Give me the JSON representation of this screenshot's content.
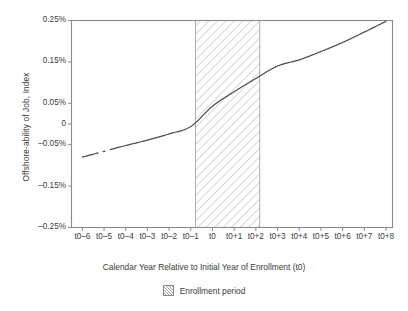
{
  "chart_data": {
    "type": "line",
    "title": "",
    "xlabel": "Calendar Year Relative to Initial Year of Enrollment (t0)",
    "ylabel": "Offshore-ability of Job, Index",
    "x_ticklabels": [
      "t0–6",
      "t0–5",
      "t0–4",
      "t0–3",
      "t0–2",
      "t0–1",
      "t0",
      "t0+1",
      "t0+2",
      "t0+3",
      "t0+4",
      "t0+5",
      "t0+6",
      "t0+7",
      "t0+8"
    ],
    "x": [
      -6,
      -5,
      -4,
      -3,
      -2,
      -1,
      0,
      1,
      2,
      3,
      4,
      5,
      6,
      7,
      8
    ],
    "y_ticklabels": [
      "0.25%",
      "0.15%",
      "0.05%",
      "0",
      "–0.05%",
      "–0.15%",
      "–0.25%"
    ],
    "y_tickvalues": [
      0.25,
      0.15,
      0.05,
      0,
      -0.05,
      -0.15,
      -0.25
    ],
    "ylim": [
      -0.25,
      0.25
    ],
    "xlim": [
      -6.5,
      8.3
    ],
    "grid": false,
    "legend_position": "below-center",
    "series": [
      {
        "name": "Offshore-ability of Job, Index",
        "color": "#4a4a4a",
        "values": [
          -0.08,
          -0.066,
          -0.052,
          -0.039,
          -0.024,
          -0.006,
          0.043,
          0.078,
          0.11,
          0.14,
          0.155,
          0.175,
          0.197,
          0.222,
          0.248
        ]
      }
    ],
    "shaded_region": {
      "label": "Enrollment period",
      "x_start": -0.78,
      "x_end": 2.18,
      "pattern": "diagonal-hatch",
      "hatch_color": "#b0b0b0",
      "fill_color": "#ffffff",
      "border_color": "#8a8a8a"
    },
    "line_break": {
      "x_start": -5.25,
      "x_end": -4.72
    }
  },
  "axis": {
    "frame_color": "#8a8a8a",
    "tick_color": "#8a8a8a",
    "text_color": "#3b3b3b"
  },
  "legend": {
    "items": [
      {
        "label": "Enrollment period",
        "swatch": "hatch-swatch"
      }
    ]
  }
}
